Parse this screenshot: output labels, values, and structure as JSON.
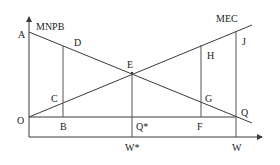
{
  "diagram": {
    "title": "",
    "curves": {
      "mnpb": {
        "label": "MNPB"
      },
      "mec": {
        "label": "MEC"
      }
    },
    "points": {
      "A": "A",
      "D": "D",
      "E": "E",
      "H": "H",
      "J": "J",
      "C": "C",
      "G": "G",
      "O": "O",
      "B": "B",
      "Q_star": "Q*",
      "F": "F",
      "Q": "Q"
    },
    "axis_labels": {
      "w_star": "W*",
      "w": "W"
    },
    "colors": {
      "line": "#3a3a3a",
      "text": "#222222",
      "background": "#ffffff"
    }
  }
}
